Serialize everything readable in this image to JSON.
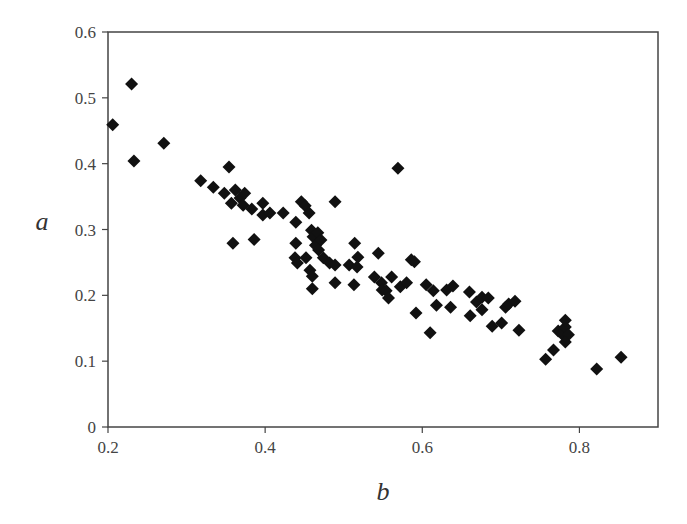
{
  "chart_data": {
    "type": "scatter",
    "title": "",
    "xlabel": "b",
    "ylabel": "a",
    "xlim": [
      0.2,
      0.9
    ],
    "ylim": [
      0,
      0.6
    ],
    "grid": false,
    "legend": null,
    "marker": "diamond",
    "marker_color": "#111111",
    "x_ticks": [
      {
        "value": 0.2,
        "label": "0.2"
      },
      {
        "value": 0.4,
        "label": "0.4"
      },
      {
        "value": 0.6,
        "label": "0.6"
      },
      {
        "value": 0.8,
        "label": "0.8"
      }
    ],
    "y_ticks": [
      {
        "value": 0,
        "label": "0"
      },
      {
        "value": 0.1,
        "label": "0.1"
      },
      {
        "value": 0.2,
        "label": "0.2"
      },
      {
        "value": 0.3,
        "label": "0.3"
      },
      {
        "value": 0.4,
        "label": "0.4"
      },
      {
        "value": 0.5,
        "label": "0.5"
      },
      {
        "value": 0.6,
        "label": "0.6"
      }
    ],
    "points": [
      [
        0.206,
        0.459
      ],
      [
        0.23,
        0.521
      ],
      [
        0.233,
        0.404
      ],
      [
        0.271,
        0.431
      ],
      [
        0.318,
        0.374
      ],
      [
        0.334,
        0.364
      ],
      [
        0.354,
        0.395
      ],
      [
        0.348,
        0.355
      ],
      [
        0.357,
        0.34
      ],
      [
        0.362,
        0.36
      ],
      [
        0.368,
        0.348
      ],
      [
        0.374,
        0.355
      ],
      [
        0.372,
        0.337
      ],
      [
        0.383,
        0.331
      ],
      [
        0.359,
        0.279
      ],
      [
        0.386,
        0.285
      ],
      [
        0.397,
        0.34
      ],
      [
        0.397,
        0.322
      ],
      [
        0.406,
        0.325
      ],
      [
        0.423,
        0.325
      ],
      [
        0.439,
        0.311
      ],
      [
        0.446,
        0.342
      ],
      [
        0.451,
        0.336
      ],
      [
        0.456,
        0.325
      ],
      [
        0.439,
        0.279
      ],
      [
        0.438,
        0.257
      ],
      [
        0.441,
        0.249
      ],
      [
        0.459,
        0.299
      ],
      [
        0.461,
        0.289
      ],
      [
        0.464,
        0.276
      ],
      [
        0.467,
        0.295
      ],
      [
        0.471,
        0.284
      ],
      [
        0.468,
        0.269
      ],
      [
        0.452,
        0.257
      ],
      [
        0.457,
        0.238
      ],
      [
        0.46,
        0.229
      ],
      [
        0.46,
        0.21
      ],
      [
        0.474,
        0.257
      ],
      [
        0.482,
        0.249
      ],
      [
        0.489,
        0.246
      ],
      [
        0.489,
        0.342
      ],
      [
        0.507,
        0.246
      ],
      [
        0.517,
        0.243
      ],
      [
        0.514,
        0.279
      ],
      [
        0.518,
        0.258
      ],
      [
        0.513,
        0.216
      ],
      [
        0.489,
        0.219
      ],
      [
        0.539,
        0.228
      ],
      [
        0.544,
        0.264
      ],
      [
        0.548,
        0.219
      ],
      [
        0.549,
        0.208
      ],
      [
        0.554,
        0.207
      ],
      [
        0.557,
        0.196
      ],
      [
        0.561,
        0.228
      ],
      [
        0.569,
        0.393
      ],
      [
        0.572,
        0.213
      ],
      [
        0.58,
        0.219
      ],
      [
        0.586,
        0.254
      ],
      [
        0.59,
        0.251
      ],
      [
        0.592,
        0.173
      ],
      [
        0.605,
        0.216
      ],
      [
        0.61,
        0.143
      ],
      [
        0.614,
        0.207
      ],
      [
        0.618,
        0.185
      ],
      [
        0.631,
        0.208
      ],
      [
        0.639,
        0.214
      ],
      [
        0.636,
        0.182
      ],
      [
        0.66,
        0.205
      ],
      [
        0.661,
        0.169
      ],
      [
        0.669,
        0.19
      ],
      [
        0.676,
        0.197
      ],
      [
        0.676,
        0.178
      ],
      [
        0.684,
        0.196
      ],
      [
        0.689,
        0.153
      ],
      [
        0.701,
        0.158
      ],
      [
        0.706,
        0.182
      ],
      [
        0.71,
        0.187
      ],
      [
        0.718,
        0.191
      ],
      [
        0.723,
        0.147
      ],
      [
        0.757,
        0.103
      ],
      [
        0.767,
        0.117
      ],
      [
        0.773,
        0.146
      ],
      [
        0.778,
        0.141
      ],
      [
        0.782,
        0.152
      ],
      [
        0.782,
        0.162
      ],
      [
        0.786,
        0.14
      ],
      [
        0.782,
        0.129
      ],
      [
        0.822,
        0.088
      ],
      [
        0.853,
        0.106
      ]
    ]
  },
  "labels": {
    "xlabel": "b",
    "ylabel": "a"
  }
}
